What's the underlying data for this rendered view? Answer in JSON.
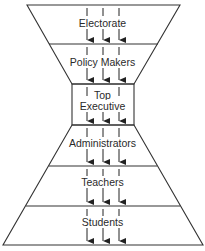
{
  "diagram": {
    "type": "hourglass-hierarchy",
    "layers": [
      {
        "label": "Electorate"
      },
      {
        "label": "Policy Makers"
      },
      {
        "label_line1": "Top",
        "label_line2": "Executive"
      },
      {
        "label": "Administrators"
      },
      {
        "label": "Teachers"
      },
      {
        "label": "Students"
      }
    ],
    "flow_direction": "downward",
    "arrow_columns": 3
  }
}
